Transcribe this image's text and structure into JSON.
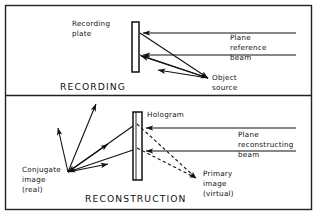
{
  "figure": {
    "kind": "optics-diagram",
    "colors": {
      "ink": "#111111",
      "background": "#ffffff",
      "frame": "#222222"
    }
  },
  "panels": [
    {
      "id": "recording",
      "title": "RECORDING",
      "labels": {
        "plate": {
          "line1": "Recording",
          "line2": "plate"
        },
        "reference_beam": {
          "line1": "Plane",
          "line2": "reference",
          "line3": "beam"
        },
        "object_source": {
          "line1": "Object",
          "line2": "source"
        }
      }
    },
    {
      "id": "reconstruction",
      "title": "RECONSTRUCTION",
      "labels": {
        "hologram": {
          "line1": "Hologram"
        },
        "reconstructing_beam": {
          "line1": "Plane",
          "line2": "reconstructing",
          "line3": "beam"
        },
        "conjugate_image": {
          "line1": "Conjugate",
          "line2": "image",
          "line3": "(real)"
        },
        "primary_image": {
          "line1": "Primary",
          "line2": "image",
          "line3": "(virtual)"
        }
      }
    }
  ]
}
